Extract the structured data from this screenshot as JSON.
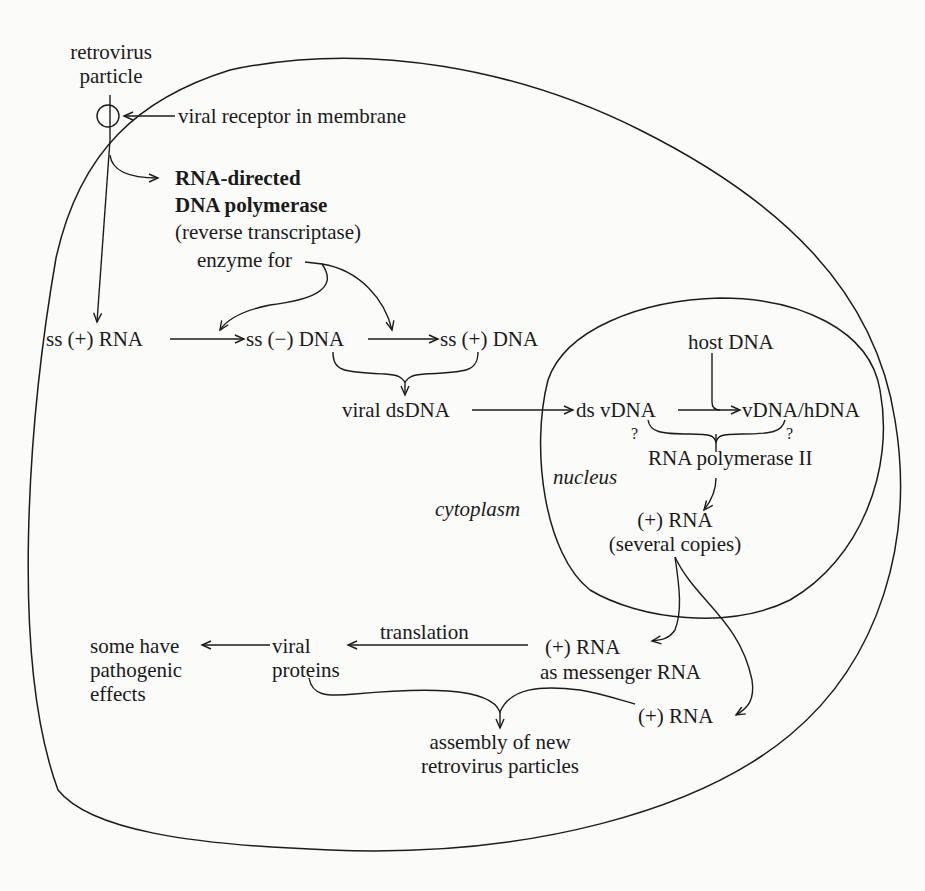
{
  "diagram": {
    "compartments": {
      "cytoplasm_label": "cytoplasm",
      "nucleus_label": "nucleus"
    },
    "labels": {
      "retrovirus_particle": [
        "retrovirus",
        "particle"
      ],
      "viral_receptor": "viral receptor in membrane",
      "enzyme_name_line1": "RNA-directed",
      "enzyme_name_line2": "DNA polymerase",
      "enzyme_alias": "(reverse transcriptase)",
      "enzyme_for": "enzyme for",
      "ss_plus_rna": "ss (+) RNA",
      "ss_minus_dna": "ss (−) DNA",
      "ss_plus_dna": "ss (+) DNA",
      "viral_dsdna": "viral dsDNA",
      "host_dna": "host DNA",
      "ds_vdna": "ds vDNA",
      "vdna_hdna": "vDNA/hDNA",
      "question_left": "?",
      "question_right": "?",
      "rna_pol_ii": "RNA polymerase II",
      "plus_rna_copies_line1": "(+) RNA",
      "plus_rna_copies_line2": "(several copies)",
      "plus_rna_mrna_line1": "(+) RNA",
      "plus_rna_mrna_line2": "as messenger RNA",
      "translation": "translation",
      "viral_proteins": [
        "viral",
        "proteins"
      ],
      "pathogenic": [
        "some have",
        "pathogenic",
        "effects"
      ],
      "plus_rna_genome": "(+) RNA",
      "assembly": [
        "assembly of new",
        "retrovirus particles"
      ]
    },
    "edges": [
      {
        "from": "retrovirus particle",
        "to": "RNA-directed DNA polymerase"
      },
      {
        "from": "retrovirus particle",
        "to": "ss (+) RNA"
      },
      {
        "from": "viral receptor in membrane",
        "to": "retrovirus particle"
      },
      {
        "from": "ss (+) RNA",
        "to": "ss (−) DNA"
      },
      {
        "from": "ss (−) DNA",
        "to": "ss (+) DNA"
      },
      {
        "from": "enzyme for",
        "to": "ss (+) RNA → ss (−) DNA"
      },
      {
        "from": "enzyme for",
        "to": "ss (−) DNA → ss (+) DNA"
      },
      {
        "from": "ss (−) DNA + ss (+) DNA",
        "to": "viral dsDNA"
      },
      {
        "from": "viral dsDNA",
        "to": "ds vDNA"
      },
      {
        "from": "ds vDNA",
        "to": "vDNA/hDNA"
      },
      {
        "from": "host DNA",
        "to": "ds vDNA → vDNA/hDNA"
      },
      {
        "from": "RNA polymerase II",
        "to": "(+) RNA (several copies)"
      },
      {
        "from": "(+) RNA (several copies)",
        "to": "(+) RNA as messenger RNA"
      },
      {
        "from": "(+) RNA (several copies)",
        "to": "(+) RNA"
      },
      {
        "from": "(+) RNA as messenger RNA",
        "to": "viral proteins",
        "label": "translation"
      },
      {
        "from": "viral proteins",
        "to": "some have pathogenic effects"
      },
      {
        "from": "viral proteins + (+) RNA",
        "to": "assembly of new retrovirus particles"
      }
    ]
  }
}
